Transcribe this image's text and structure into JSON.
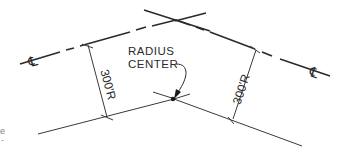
{
  "diagram": {
    "type": "horizontal-curve-layout",
    "colors": {
      "background": "#ffffff",
      "line": "#2a2a2a",
      "thin_line": "#3a3a3a"
    },
    "centerline": {
      "symbol_left": "℄",
      "symbol_right": "℄"
    },
    "radius_center_label_line1": "RADIUS",
    "radius_center_label_line2": "CENTER",
    "dimensions": [
      {
        "label": "300'R",
        "side": "left"
      },
      {
        "label": "300'R",
        "side": "right"
      }
    ],
    "edge_marks": [
      "e",
      "-"
    ]
  }
}
